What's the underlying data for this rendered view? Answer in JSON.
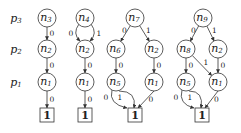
{
  "diagram": {
    "type": "decision-diagrams",
    "rows": [
      {
        "id": "p3",
        "label": "p",
        "sub": "3",
        "y": 18
      },
      {
        "id": "p2",
        "label": "p",
        "sub": "2",
        "y": 49
      },
      {
        "id": "p1",
        "label": "p",
        "sub": "1",
        "y": 82
      }
    ],
    "graphs": [
      {
        "name": "graph-n3",
        "nodes": [
          {
            "id": "n3",
            "label": "n",
            "sub": "3",
            "x": 47,
            "y": 18
          },
          {
            "id": "n2",
            "label": "n",
            "sub": "2",
            "x": 47,
            "y": 49
          },
          {
            "id": "n1",
            "label": "n",
            "sub": "1",
            "x": 47,
            "y": 82
          }
        ],
        "terminal": {
          "label": "1",
          "x": 47,
          "y": 115
        },
        "edges": [
          {
            "from": "n3",
            "to": "n2",
            "label": "0"
          },
          {
            "from": "n2",
            "to": "n1",
            "label": "0"
          },
          {
            "from": "n1",
            "to": "T",
            "label": "0"
          }
        ]
      },
      {
        "name": "graph-n4",
        "nodes": [
          {
            "id": "n4",
            "label": "n",
            "sub": "4",
            "x": 85,
            "y": 18
          },
          {
            "id": "n2",
            "label": "n",
            "sub": "2",
            "x": 85,
            "y": 49
          },
          {
            "id": "n1",
            "label": "n",
            "sub": "1",
            "x": 85,
            "y": 82
          }
        ],
        "terminal": {
          "label": "1",
          "x": 85,
          "y": 115
        },
        "edges": [
          {
            "from": "n4",
            "to": "n2",
            "label": "0"
          },
          {
            "from": "n4",
            "to": "n2",
            "label": "1"
          },
          {
            "from": "n2",
            "to": "n1",
            "label": "0"
          },
          {
            "from": "n1",
            "to": "T",
            "label": "0"
          }
        ]
      },
      {
        "name": "graph-n7",
        "nodes": [
          {
            "id": "n7",
            "label": "n",
            "sub": "7",
            "x": 135,
            "y": 18
          },
          {
            "id": "n6",
            "label": "n",
            "sub": "6",
            "x": 116,
            "y": 49
          },
          {
            "id": "n2",
            "label": "n",
            "sub": "2",
            "x": 154,
            "y": 49
          },
          {
            "id": "n5",
            "label": "n",
            "sub": "5",
            "x": 116,
            "y": 82
          },
          {
            "id": "n1",
            "label": "n",
            "sub": "1",
            "x": 154,
            "y": 82
          }
        ],
        "terminal": {
          "label": "1",
          "x": 135,
          "y": 115
        },
        "edges": [
          {
            "from": "n7",
            "to": "n6",
            "label": "0"
          },
          {
            "from": "n7",
            "to": "n2",
            "label": "1"
          },
          {
            "from": "n6",
            "to": "n5",
            "label": "0"
          },
          {
            "from": "n2",
            "to": "n1",
            "label": "0"
          },
          {
            "from": "n5",
            "to": "T",
            "label": "0"
          },
          {
            "from": "n5",
            "to": "T",
            "label": "1"
          },
          {
            "from": "n1",
            "to": "T",
            "label": "0"
          }
        ]
      },
      {
        "name": "graph-n9",
        "nodes": [
          {
            "id": "n9",
            "label": "n",
            "sub": "9",
            "x": 203,
            "y": 18
          },
          {
            "id": "n8",
            "label": "n",
            "sub": "8",
            "x": 186,
            "y": 49
          },
          {
            "id": "n2",
            "label": "n",
            "sub": "2",
            "x": 218,
            "y": 49
          },
          {
            "id": "n5",
            "label": "n",
            "sub": "5",
            "x": 186,
            "y": 82
          },
          {
            "id": "n1",
            "label": "n",
            "sub": "1",
            "x": 218,
            "y": 82
          }
        ],
        "terminal": {
          "label": "1",
          "x": 202,
          "y": 115
        },
        "edges": [
          {
            "from": "n9",
            "to": "n8",
            "label": "0"
          },
          {
            "from": "n9",
            "to": "n2",
            "label": "1"
          },
          {
            "from": "n8",
            "to": "n5",
            "label": "0"
          },
          {
            "from": "n8",
            "to": "n1",
            "label": "1"
          },
          {
            "from": "n2",
            "to": "n1",
            "label": "0"
          },
          {
            "from": "n5",
            "to": "T",
            "label": "0"
          },
          {
            "from": "n5",
            "to": "T",
            "label": "1"
          },
          {
            "from": "n1",
            "to": "T",
            "label": "0"
          }
        ]
      }
    ]
  }
}
